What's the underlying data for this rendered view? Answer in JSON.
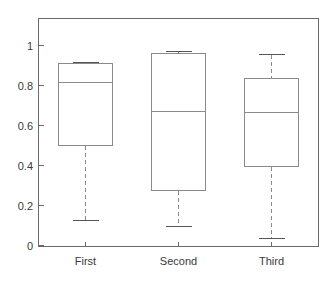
{
  "chart_data": {
    "type": "box",
    "title": "",
    "xlabel": "",
    "ylabel": "",
    "categories": [
      "First",
      "Second",
      "Third"
    ],
    "ylim": [
      0,
      1.15
    ],
    "xlim": [
      0.5,
      3.5
    ],
    "yticks": [
      0,
      0.2,
      0.4,
      0.6,
      0.8,
      1
    ],
    "ytick_labels": [
      "0",
      "0.2",
      "0.4",
      "0.6",
      "0.8",
      "1"
    ],
    "grid": false,
    "legend": null,
    "boxes": [
      {
        "label": "First",
        "whisker_low": 0.125,
        "q1": 0.5,
        "median": 0.815,
        "q3": 0.91,
        "whisker_high": 0.915,
        "outliers": []
      },
      {
        "label": "Second",
        "whisker_low": 0.095,
        "q1": 0.275,
        "median": 0.67,
        "q3": 0.96,
        "whisker_high": 0.97,
        "outliers": []
      },
      {
        "label": "Third",
        "whisker_low": 0.035,
        "q1": 0.395,
        "median": 0.665,
        "q3": 0.835,
        "whisker_high": 0.955,
        "outliers": []
      }
    ],
    "style": {
      "box_stroke": "#8a8a8a",
      "median_stroke": "#8a8a8a",
      "whisker_stroke": "#8a8a8a",
      "cap_stroke": "#555555",
      "axis_stroke": "#6b6b6b",
      "tick_text_color": "#3a3a3a",
      "background": "#ffffff"
    },
    "geometry": {
      "plot_left": 38,
      "plot_right": 318,
      "plot_top": 18,
      "plot_bottom": 246,
      "y_zero_px": 245,
      "y_unit_px": 200,
      "box_half_width": 27
    }
  }
}
